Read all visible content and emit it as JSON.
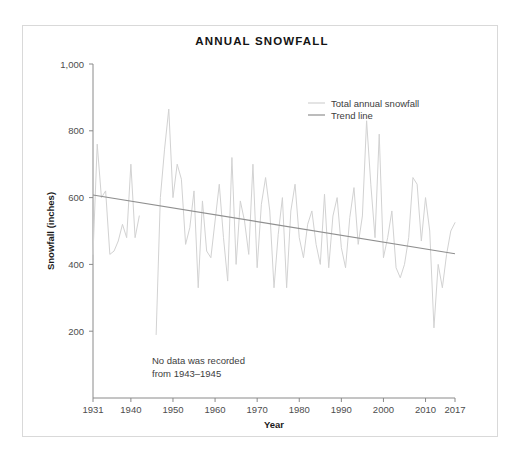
{
  "figure": {
    "title": "ANNUAL SNOWFALL",
    "annotation_line1": "No data was recorded",
    "annotation_line2": "from 1943–1945",
    "legend": {
      "series_label": "Total annual snowfall",
      "trend_label": "Trend line"
    },
    "colors": {
      "series": "#d2d2d2",
      "trend": "#8f8f8f",
      "axis": "#8a8a8a",
      "frame": "#d9d9d9",
      "text": "#1a1a1a",
      "background": "#ffffff"
    }
  },
  "chart_data": {
    "type": "line",
    "title": "ANNUAL SNOWFALL",
    "xlabel": "Year",
    "ylabel": "Snowfall (inches)",
    "xlim": [
      1931,
      2017
    ],
    "ylim": [
      0,
      1000
    ],
    "yticks": [
      200,
      400,
      600,
      800,
      1000
    ],
    "ytick_labels": [
      "200",
      "400",
      "600",
      "800",
      "1,000"
    ],
    "xticks": [
      1931,
      1940,
      1950,
      1960,
      1970,
      1980,
      1990,
      2000,
      2010,
      2017
    ],
    "xtick_labels": [
      "1931",
      "1940",
      "1950",
      "1960",
      "1970",
      "1980",
      "1990",
      "2000",
      "2010",
      "2017"
    ],
    "grid": false,
    "legend_position": "upper right",
    "annotations": [
      {
        "text": "No data was recorded from 1943–1945",
        "x": 1957,
        "y": 125
      }
    ],
    "series": [
      {
        "name": "Total annual snowfall",
        "color": "#d2d2d2",
        "missing_years": [
          1943,
          1944,
          1945
        ],
        "x": [
          1931,
          1932,
          1933,
          1934,
          1935,
          1936,
          1937,
          1938,
          1939,
          1940,
          1941,
          1942,
          1946,
          1947,
          1948,
          1949,
          1950,
          1951,
          1952,
          1953,
          1954,
          1955,
          1956,
          1957,
          1958,
          1959,
          1960,
          1961,
          1962,
          1963,
          1964,
          1965,
          1966,
          1967,
          1968,
          1969,
          1970,
          1971,
          1972,
          1973,
          1974,
          1975,
          1976,
          1977,
          1978,
          1979,
          1980,
          1981,
          1982,
          1983,
          1984,
          1985,
          1986,
          1987,
          1988,
          1989,
          1990,
          1991,
          1992,
          1993,
          1994,
          1995,
          1996,
          1997,
          1998,
          1999,
          2000,
          2001,
          2002,
          2003,
          2004,
          2005,
          2006,
          2007,
          2008,
          2009,
          2010,
          2011,
          2012,
          2013,
          2014,
          2015,
          2016,
          2017
        ],
        "y": [
          430,
          760,
          600,
          620,
          430,
          440,
          470,
          520,
          480,
          700,
          480,
          545,
          190,
          600,
          745,
          865,
          600,
          700,
          655,
          460,
          510,
          620,
          330,
          590,
          440,
          420,
          530,
          640,
          480,
          350,
          720,
          400,
          590,
          530,
          430,
          700,
          390,
          580,
          660,
          560,
          330,
          490,
          600,
          330,
          560,
          640,
          480,
          420,
          520,
          560,
          460,
          400,
          610,
          390,
          545,
          600,
          450,
          390,
          540,
          630,
          460,
          545,
          830,
          640,
          480,
          790,
          420,
          480,
          560,
          390,
          360,
          400,
          480,
          660,
          640,
          470,
          600,
          500,
          210,
          400,
          330,
          430,
          500,
          525
        ]
      }
    ],
    "trend": {
      "name": "Trend line",
      "color": "#8f8f8f",
      "x": [
        1931,
        2017
      ],
      "y": [
        608,
        432
      ]
    }
  }
}
